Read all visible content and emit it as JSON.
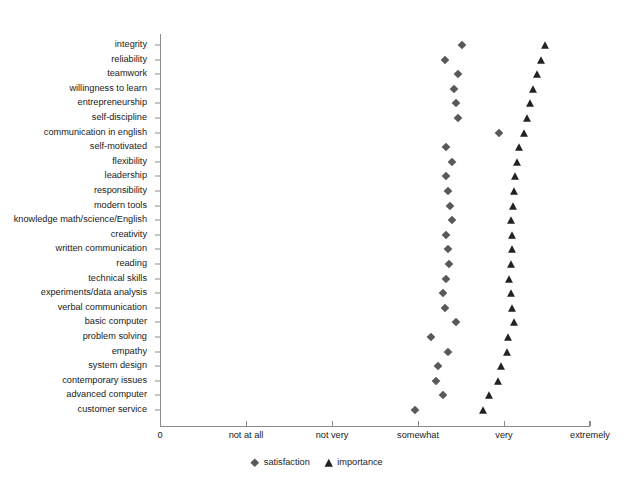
{
  "chart_data": {
    "type": "scatter",
    "title": "",
    "subtitle": "",
    "xlabel": "",
    "ylabel": "",
    "orientation": "horizontal",
    "grid": false,
    "legend_position": "bottom-center",
    "x_ticklabels": [
      "0",
      "not at all",
      "not very",
      "somewhat",
      "very",
      "extremely"
    ],
    "x_tickvalues": [
      0,
      1,
      2,
      3,
      4,
      5
    ],
    "xlim": [
      0,
      5
    ],
    "categories": [
      "integrity",
      "reliability",
      "teamwork",
      "willingness to learn",
      "entrepreneurship",
      "self-discipline",
      "communication in english",
      "self-motivated",
      "flexibility",
      "leadership",
      "responsibility",
      "modern tools",
      "knowledge math/science/English",
      "creativity",
      "written communication",
      "reading",
      "technical skills",
      "experiments/data analysis",
      "verbal communication",
      "basic computer",
      "problem solving",
      "empathy",
      "system design",
      "contemporary issues",
      "advanced computer",
      "customer service"
    ],
    "series": [
      {
        "name": "satisfaction",
        "marker": "diamond",
        "color": "#595959",
        "values": [
          3.51,
          3.31,
          3.47,
          3.42,
          3.44,
          3.46,
          3.94,
          3.33,
          3.4,
          3.33,
          3.35,
          3.37,
          3.39,
          3.33,
          3.35,
          3.36,
          3.32,
          3.29,
          3.31,
          3.44,
          3.15,
          3.35,
          3.23,
          3.21,
          3.29,
          2.97
        ]
      },
      {
        "name": "importance",
        "marker": "triangle",
        "color": "#222222",
        "values": [
          4.48,
          4.43,
          4.38,
          4.34,
          4.3,
          4.27,
          4.23,
          4.17,
          4.15,
          4.13,
          4.12,
          4.1,
          4.08,
          4.09,
          4.09,
          4.08,
          4.06,
          4.08,
          4.09,
          4.12,
          4.05,
          4.03,
          3.97,
          3.93,
          3.83,
          3.76
        ]
      }
    ]
  },
  "legend": {
    "entries": [
      {
        "label": "satisfaction",
        "marker": "diamond",
        "color": "#595959"
      },
      {
        "label": "importance",
        "marker": "triangle",
        "color": "#222222"
      }
    ]
  }
}
